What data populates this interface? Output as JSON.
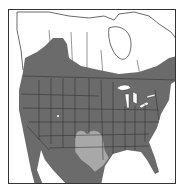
{
  "map": {
    "type": "species-range-map",
    "region": "North America",
    "legend": [],
    "colors": {
      "background": "#ffffff",
      "land": "#ffffff",
      "range_primary": "#6b6b6b",
      "range_secondary": "#a8a8a8",
      "borders": "#2a2a2a",
      "water_lakes": "#ffffff"
    },
    "areas": [
      {
        "name": "primary-range",
        "description": "Most of contiguous US, southern Canada, Mexico"
      },
      {
        "name": "secondary-range",
        "description": "Texas and southern Oklahoma/New Mexico"
      }
    ]
  }
}
